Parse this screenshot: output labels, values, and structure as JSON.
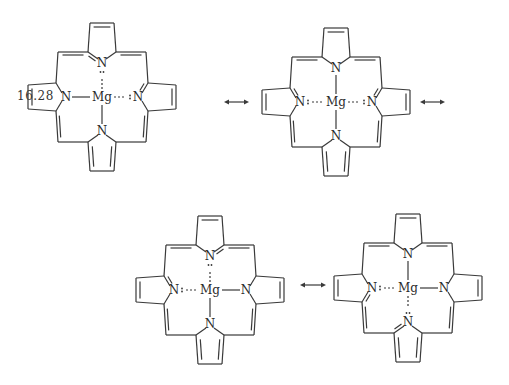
{
  "figure": {
    "equation_number": "16.28",
    "central_atom": "Mg",
    "ring_atom": "N",
    "resonance_arrow": "↔",
    "line_color": "#3a3a3a"
  },
  "structures": [
    {
      "id": 1,
      "cx": 102,
      "cy": 97,
      "bonds": {
        "top": "dative",
        "left": "covalent",
        "right": "dative",
        "bottom": "covalent"
      },
      "double_to_N": {
        "top": "left",
        "left": "none",
        "right": "top",
        "bottom": "none"
      }
    },
    {
      "id": 2,
      "cx": 336,
      "cy": 102,
      "bonds": {
        "top": "covalent",
        "left": "dative",
        "right": "dative",
        "bottom": "covalent"
      },
      "double_to_N": {
        "top": "none",
        "left": "top",
        "right": "top",
        "bottom": "none"
      }
    },
    {
      "id": 3,
      "cx": 210,
      "cy": 290,
      "bonds": {
        "top": "dative",
        "left": "dative",
        "right": "covalent",
        "bottom": "covalent"
      },
      "double_to_N": {
        "top": "right",
        "left": "top",
        "right": "none",
        "bottom": "none"
      }
    },
    {
      "id": 4,
      "cx": 408,
      "cy": 288,
      "bonds": {
        "top": "covalent",
        "left": "dative",
        "right": "covalent",
        "bottom": "dative"
      },
      "double_to_N": {
        "top": "none",
        "left": "bottom",
        "right": "none",
        "bottom": "left"
      }
    }
  ],
  "arrows": [
    {
      "x1": 224,
      "x2": 249,
      "y": 102
    },
    {
      "x1": 420,
      "x2": 445,
      "y": 102
    },
    {
      "x1": 300,
      "x2": 326,
      "y": 285
    }
  ]
}
